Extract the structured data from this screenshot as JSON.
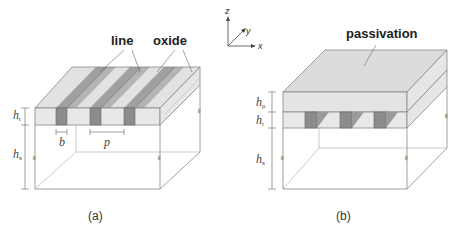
{
  "figure": {
    "axes": {
      "z": "z",
      "y": "y",
      "x": "x"
    },
    "panel_a": {
      "caption": "(a)",
      "labels": {
        "line": "line",
        "oxide": "oxide"
      },
      "dimensions": {
        "h_t": "h",
        "h_t_sub": "t",
        "h_s": "h",
        "h_s_sub": "s",
        "b": "b",
        "p": "p"
      },
      "break_symbol": "≈"
    },
    "panel_b": {
      "caption": "(b)",
      "labels": {
        "passivation": "passivation"
      },
      "dimensions": {
        "h_p": "h",
        "h_p_sub": "p",
        "h_t": "h",
        "h_t_sub": "t",
        "h_s": "h",
        "h_s_sub": "s"
      },
      "break_symbol": "≈"
    },
    "colors": {
      "line_dark": "#8c8c8c",
      "line_top": "#a6a6a6",
      "oxide_light": "#e2e2e2",
      "oxide_top": "#d6d6d6",
      "passivation": "#dcdcdc",
      "edge": "#888888"
    }
  }
}
